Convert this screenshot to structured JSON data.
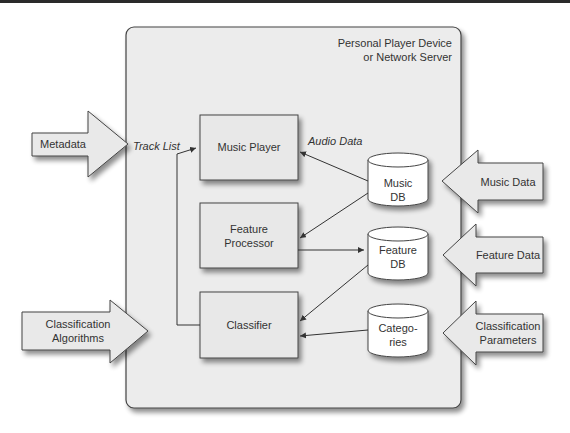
{
  "container": {
    "title_line1": "Personal Player Device",
    "title_line2": "or Network Server"
  },
  "boxes": {
    "music_player": "Music Player",
    "feature_processor_line1": "Feature",
    "feature_processor_line2": "Processor",
    "classifier": "Classifier"
  },
  "databases": {
    "music_db_line1": "Music",
    "music_db_line2": "DB",
    "feature_db_line1": "Feature",
    "feature_db_line2": "DB",
    "categories_line1": "Catego-",
    "categories_line2": "ries"
  },
  "inputs_left": {
    "metadata": "Metadata",
    "classification_algorithms_line1": "Classification",
    "classification_algorithms_line2": "Algorithms"
  },
  "inputs_right": {
    "music_data": "Music Data",
    "feature_data": "Feature Data",
    "classification_parameters_line1": "Classification",
    "classification_parameters_line2": "Parameters"
  },
  "edge_labels": {
    "track_list": "Track List",
    "audio_data": "Audio Data"
  },
  "colors": {
    "container_fill": "#ececec",
    "box_fill": "#e8e8e8",
    "db_fill": "#ffffff",
    "arrow_fill": "#e9e9e9",
    "stroke": "#444444"
  }
}
